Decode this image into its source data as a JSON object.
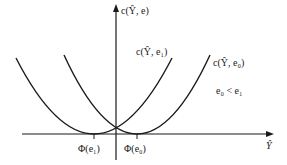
{
  "diagram": {
    "y_axis_label": "c(Ŷ, e)",
    "x_axis_label": "Ŷ",
    "curves": [
      {
        "name": "c-Y-e1",
        "label": "c(Ŷ, e₁)",
        "minimum_label": "Φ(e₁)"
      },
      {
        "name": "c-Y-e0",
        "label": "c(Ŷ, e₀)",
        "minimum_label": "Φ(e₀)"
      }
    ],
    "annotation": "e₀ < e₁",
    "line_color": "#1a1a1a"
  }
}
